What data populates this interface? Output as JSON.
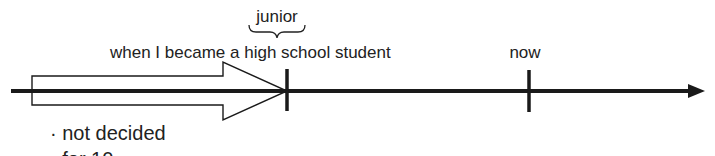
{
  "diagram": {
    "type": "timeline",
    "colors": {
      "line": "#1a1a1a",
      "text": "#222222",
      "background": "#ffffff"
    },
    "brace_label": "junior",
    "markers": [
      {
        "id": "high-school",
        "label": "when I became a high school student"
      },
      {
        "id": "now",
        "label": "now"
      }
    ],
    "notes": [
      "· not decided",
      "· for 10 ..."
    ],
    "span_arrow": {
      "from": "start",
      "to": "high-school",
      "style": "hollow-block-arrow"
    }
  }
}
